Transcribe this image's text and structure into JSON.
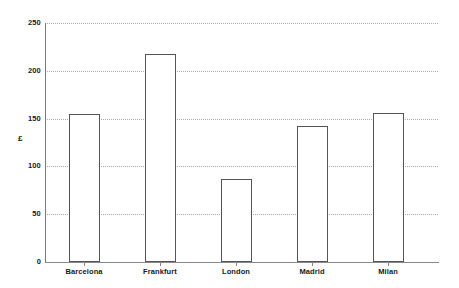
{
  "chart_data": {
    "type": "bar",
    "title": "",
    "subtitle": "",
    "xlabel": "",
    "ylabel": "£",
    "categories": [
      "Barcelona",
      "Frankfurt",
      "London",
      "Madrid",
      "Milan"
    ],
    "values": [
      155,
      218,
      87,
      142,
      156
    ],
    "ylim": [
      0,
      250
    ],
    "ytick_labels": [
      "0",
      "50",
      "100",
      "150",
      "200",
      "250"
    ],
    "ytick_values": [
      0,
      50,
      100,
      150,
      200,
      250
    ],
    "grid": true,
    "grid_axis": "y",
    "grid_style": "dotted",
    "legend": false,
    "legend_position": "none",
    "series": [
      {
        "name": "",
        "values": [
          155,
          218,
          87,
          142,
          156
        ]
      }
    ],
    "annotations": [],
    "colors": {
      "bar_fill": "#ffffff",
      "bar_edge": "#555555",
      "gridline": "#aaaaaa",
      "axis": "#8a8a8a",
      "text": "#1a1a1a",
      "background": "#ffffff"
    }
  },
  "axes": {
    "y_title": "£",
    "ticks_y": [
      {
        "label": "250",
        "value": 250
      },
      {
        "label": "200",
        "value": 200
      },
      {
        "label": "150",
        "value": 150
      },
      {
        "label": "100",
        "value": 100
      },
      {
        "label": "50",
        "value": 50
      },
      {
        "label": "0",
        "value": 0
      }
    ],
    "ticks_x": [
      {
        "label": "Barcelona"
      },
      {
        "label": "Frankfurt"
      },
      {
        "label": "London"
      },
      {
        "label": "Madrid"
      },
      {
        "label": "Milan"
      }
    ]
  }
}
